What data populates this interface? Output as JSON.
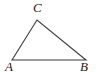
{
  "figure": {
    "kind": "triangle-diagram",
    "background_color": "#ffffff",
    "stroke_color": "#3a3a3a",
    "label_color": "#1a1a1a",
    "stroke_width": 1.1,
    "vertices": [
      {
        "name": "A",
        "label": "A",
        "x": 12,
        "y": 60,
        "label_x": 5,
        "label_y": 60
      },
      {
        "name": "B",
        "label": "B",
        "x": 86,
        "y": 60,
        "label_x": 80,
        "label_y": 60
      },
      {
        "name": "C",
        "label": "C",
        "x": 37,
        "y": 20,
        "label_x": 33,
        "label_y": 1
      }
    ],
    "edges": [
      {
        "name": "side-AB",
        "from": "A",
        "to": "B"
      },
      {
        "name": "side-AC",
        "from": "A",
        "to": "C"
      },
      {
        "name": "side-BC",
        "from": "C",
        "to": "B"
      }
    ],
    "polygon_points": "12,60 37,20 86,60"
  }
}
